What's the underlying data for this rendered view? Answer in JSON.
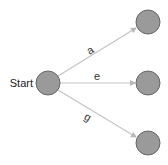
{
  "diagram": {
    "type": "state-transition",
    "colors": {
      "node_fill": "#9a9a9a",
      "node_stroke": "#666666",
      "edge": "#c4c4c4",
      "text": "#222222"
    },
    "nodes": [
      {
        "id": "start",
        "label": "Start",
        "cx": 48,
        "cy": 83,
        "r": 12
      },
      {
        "id": "n1",
        "label": "",
        "cx": 148,
        "cy": 22,
        "r": 12
      },
      {
        "id": "n2",
        "label": "",
        "cx": 148,
        "cy": 83,
        "r": 12
      },
      {
        "id": "n3",
        "label": "",
        "cx": 148,
        "cy": 143,
        "r": 12
      }
    ],
    "edges": [
      {
        "from": "start",
        "to": "n1",
        "label": "a"
      },
      {
        "from": "start",
        "to": "n2",
        "label": "e"
      },
      {
        "from": "start",
        "to": "n3",
        "label": "g"
      }
    ]
  }
}
